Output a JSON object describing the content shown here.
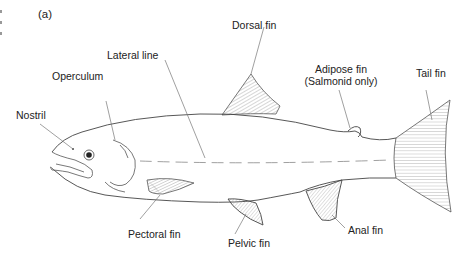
{
  "figure": {
    "panel_label": "(a)",
    "labels": {
      "dorsal_fin": "Dorsal fin",
      "lateral_line": "Lateral line",
      "operculum": "Operculum",
      "nostril": "Nostril",
      "adipose_fin": "Adipose fin",
      "adipose_note": "(Salmonid only)",
      "tail_fin": "Tail fin",
      "pectoral_fin": "Pectoral fin",
      "pelvic_fin": "Pelvic fin",
      "anal_fin": "Anal fin"
    },
    "colors": {
      "outline": "#444444",
      "hatch": "#8a8a8a",
      "leader": "#777777",
      "text": "#222222"
    }
  }
}
